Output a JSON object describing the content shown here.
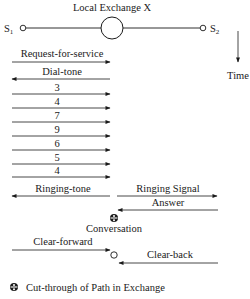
{
  "title": "Local Exchange X",
  "stations": {
    "s1": {
      "label": "S",
      "sub": "1"
    },
    "s2": {
      "label": "S",
      "sub": "2"
    }
  },
  "time_axis": {
    "label": "Time"
  },
  "signals": [
    {
      "label": "Request-for-service",
      "direction": "right"
    },
    {
      "label": "Dial-tone",
      "direction": "left"
    },
    {
      "label": "3",
      "direction": "right"
    },
    {
      "label": "4",
      "direction": "right"
    },
    {
      "label": "7",
      "direction": "right"
    },
    {
      "label": "9",
      "direction": "right"
    },
    {
      "label": "6",
      "direction": "right"
    },
    {
      "label": "5",
      "direction": "right"
    },
    {
      "label": "4",
      "direction": "right"
    },
    {
      "label": "Ringing-tone",
      "direction": "left"
    },
    {
      "label": "Ringing Signal",
      "direction": "right"
    },
    {
      "label": "Answer",
      "direction": "left"
    },
    {
      "label": "Clear-forward",
      "direction": "right"
    },
    {
      "label": "Clear-back",
      "direction": "left"
    }
  ],
  "conversation": {
    "label": "Conversation",
    "icon": "cut-through-icon"
  },
  "legend": {
    "icon": "cut-through-icon",
    "label": "Cut-through of Path in Exchange"
  },
  "colors": {
    "line": "#1a1a1a",
    "background": "#ffffff"
  }
}
